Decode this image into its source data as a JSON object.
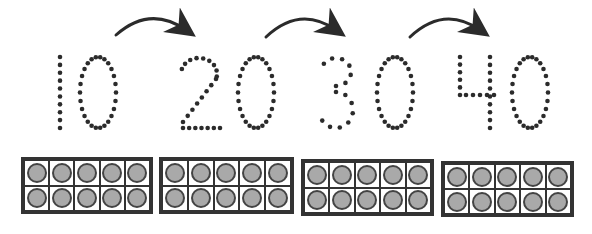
{
  "worksheet": {
    "numbers": [
      "10",
      "20",
      "30",
      "40"
    ],
    "ten_frames": [
      {
        "label": "10",
        "filled": 10
      },
      {
        "label": "20",
        "filled": 10
      },
      {
        "label": "30",
        "filled": 10
      },
      {
        "label": "40",
        "filled": 10
      }
    ],
    "arrows": [
      {
        "from": "10",
        "to": "20"
      },
      {
        "from": "20",
        "to": "30"
      },
      {
        "from": "30",
        "to": "40"
      }
    ],
    "colors": {
      "ink": "#333333",
      "counter_fill": "#a9a9a9",
      "dot": "#2b2b2b"
    }
  }
}
